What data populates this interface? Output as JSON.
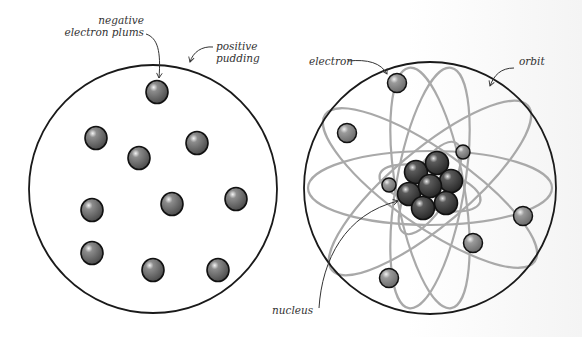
{
  "diagrams": {
    "plum_pudding": {
      "labels": {
        "plums_line1": "negative",
        "plums_line2": "electron plums",
        "pudding_line1": "positive",
        "pudding_line2": "pudding"
      },
      "colors": {
        "outline": "#1a1a1a",
        "plum": "#6a6a6a"
      }
    },
    "rutherford_bohr": {
      "labels": {
        "electron": "electron",
        "orbit": "orbit",
        "nucleus": "nucleus"
      },
      "colors": {
        "outline": "#1a1a1a",
        "orbit": "#a9a9a9",
        "electron": "#8a8a8a",
        "nucleus": "#3e3e3e"
      }
    }
  }
}
